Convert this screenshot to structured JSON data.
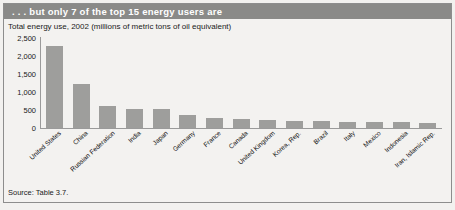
{
  "figure": {
    "title": ". . . but only 7 of the top 15 energy users are",
    "subtitle": "Total energy use, 2002 (millions of metric tons of oil equivalent)",
    "source": "Source: Table 3.7.",
    "colors": {
      "title_bar": "#8a8a88",
      "title_text": "#ffffff",
      "bar_fill": "#9e9e9c",
      "axis": "#9a9a9a",
      "panel_bg": "#f3f2f0",
      "frame_border": "#8d8d8d"
    }
  },
  "chart_data": {
    "type": "bar",
    "title": "Total energy use, 2002 (millions of metric tons of oil equivalent)",
    "xlabel": "",
    "ylabel": "",
    "ylim": [
      0,
      2500
    ],
    "yticks": [
      2500,
      2000,
      1500,
      1000,
      500,
      0
    ],
    "ytick_labels": [
      "2,500",
      "2,000",
      "1,500",
      "1,000",
      "500",
      "0"
    ],
    "grid": false,
    "legend": null,
    "categories": [
      "United States",
      "China",
      "Russian Federation",
      "India",
      "Japan",
      "Germany",
      "France",
      "Canada",
      "United Kingdom",
      "Korea, Rep.",
      "Brazil",
      "Italy",
      "Mexico",
      "Indonesia",
      "Iran, Islamic Rep."
    ],
    "values": [
      2290,
      1220,
      620,
      540,
      520,
      350,
      270,
      260,
      230,
      200,
      190,
      180,
      160,
      155,
      130
    ]
  }
}
